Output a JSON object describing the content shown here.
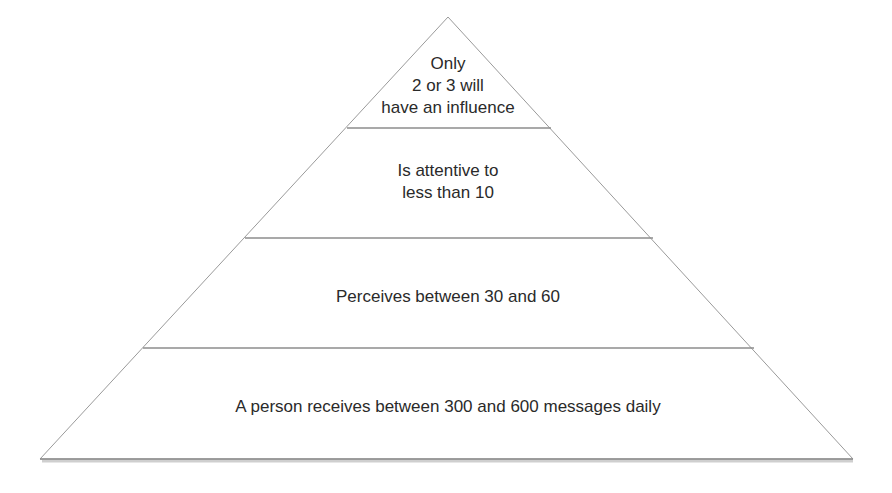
{
  "diagram": {
    "type": "pyramid",
    "colors": {
      "outline": "#9a9a9a",
      "divider": "#8c8c8c",
      "fill": "#ffffff",
      "text": "#2a2a2a"
    },
    "tiers": [
      {
        "level": 1,
        "label": "Only\n2 or 3 will\nhave an influence"
      },
      {
        "level": 2,
        "label": "Is attentive to\nless than 10"
      },
      {
        "level": 3,
        "label": "Perceives between 30 and 60"
      },
      {
        "level": 4,
        "label": "A person receives between 300 and 600 messages daily"
      }
    ]
  }
}
